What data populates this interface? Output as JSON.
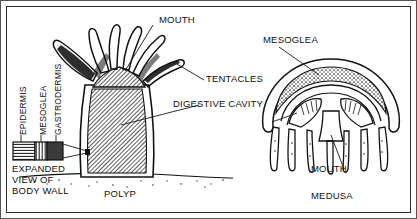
{
  "figure": {
    "kind": "cnidarian-body-forms-diagram",
    "style": "black-and-white line drawing"
  },
  "labels": {
    "mouth_polyp": "MOUTH",
    "tentacles": "TENTACLES",
    "digestive_cavity": "DIGESTIVE CAVITY",
    "mesoglea_medusa": "MESOGLEA",
    "mouth_medusa": "MOUTH",
    "medusa": "MEDUSA",
    "polyp": "POLYP"
  },
  "wall_layers": {
    "epidermis": "EPIDERMIS",
    "mesoglea": "MESOGLEA",
    "gastrodermis": "GASTRODERMIS"
  },
  "inset_caption": {
    "line1": "EXPANDED",
    "line2": "VIEW OF",
    "line3": "BODY WALL"
  },
  "colors": {
    "ink": "#111111",
    "paper": "#ffffff",
    "border": "#2b2b2b"
  }
}
